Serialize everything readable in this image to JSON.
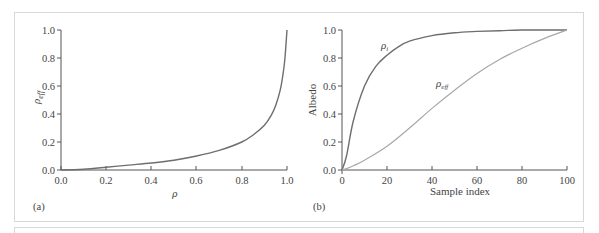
{
  "chart_data": [
    {
      "panel": "(a)",
      "type": "line",
      "title": "",
      "xlabel": "ρ",
      "ylabel": "ρ_eff",
      "xlim": [
        0.0,
        1.0
      ],
      "ylim": [
        0.0,
        1.0
      ],
      "x_ticks": [
        "0.0",
        "0.2",
        "0.4",
        "0.6",
        "0.8",
        "1.0"
      ],
      "y_ticks": [
        "0.0",
        "0.2",
        "0.4",
        "0.6",
        "0.8",
        "1.0"
      ],
      "grid": false,
      "legend": null,
      "series": [
        {
          "name": "ρ_eff",
          "x": [
            0.0,
            0.1,
            0.2,
            0.3,
            0.4,
            0.5,
            0.6,
            0.7,
            0.8,
            0.85,
            0.9,
            0.93,
            0.95,
            0.97,
            0.98,
            0.99,
            1.0
          ],
          "y": [
            0.0,
            0.006,
            0.02,
            0.035,
            0.05,
            0.07,
            0.1,
            0.14,
            0.2,
            0.25,
            0.32,
            0.39,
            0.46,
            0.57,
            0.66,
            0.78,
            1.0
          ]
        }
      ]
    },
    {
      "panel": "(b)",
      "type": "line",
      "title": "",
      "xlabel": "Sample index",
      "ylabel": "Albedo",
      "xlim": [
        0,
        100
      ],
      "ylim": [
        0.0,
        1.0
      ],
      "x_ticks": [
        "0",
        "20",
        "40",
        "60",
        "80",
        "100"
      ],
      "y_ticks": [
        "0.0",
        "0.2",
        "0.4",
        "0.6",
        "0.8",
        "1.0"
      ],
      "grid": false,
      "legend": null,
      "annotations": [
        {
          "text": "ρ_i",
          "x": 17,
          "y": 0.86
        },
        {
          "text": "ρ_eff",
          "x": 42,
          "y": 0.6
        }
      ],
      "series": [
        {
          "name": "ρ_i",
          "x": [
            0,
            2,
            5,
            10,
            15,
            20,
            25,
            30,
            40,
            50,
            60,
            70,
            80,
            90,
            100
          ],
          "y": [
            0.0,
            0.1,
            0.35,
            0.6,
            0.74,
            0.82,
            0.88,
            0.92,
            0.96,
            0.98,
            0.99,
            0.995,
            1.0,
            1.0,
            1.0
          ]
        },
        {
          "name": "ρ_eff",
          "x": [
            0,
            2,
            5,
            10,
            20,
            30,
            40,
            50,
            60,
            70,
            80,
            90,
            100
          ],
          "y": [
            0.0,
            0.01,
            0.03,
            0.07,
            0.17,
            0.3,
            0.44,
            0.57,
            0.69,
            0.79,
            0.87,
            0.94,
            1.0
          ]
        }
      ]
    }
  ],
  "labels": {
    "a": {
      "panel": "(a)",
      "xlabel": "ρ",
      "ylabel_base": "ρ",
      "ylabel_sub": "eff",
      "x_ticks": [
        "0.0",
        "0.2",
        "0.4",
        "0.6",
        "0.8",
        "1.0"
      ],
      "y_ticks": [
        "0.0",
        "0.2",
        "0.4",
        "0.6",
        "0.8",
        "1.0"
      ]
    },
    "b": {
      "panel": "(b)",
      "xlabel": "Sample index",
      "ylabel": "Albedo",
      "x_ticks": [
        "0",
        "20",
        "40",
        "60",
        "80",
        "100"
      ],
      "y_ticks": [
        "0.0",
        "0.2",
        "0.4",
        "0.6",
        "0.8",
        "1.0"
      ],
      "annot_i_base": "ρ",
      "annot_i_sub": "i",
      "annot_eff_base": "ρ",
      "annot_eff_sub": "eff"
    }
  },
  "colors": {
    "axis": "#555555",
    "curve_dark": "#6e6e6e",
    "curve_light": "#a8a8a8",
    "frame": "#d8d8d8"
  }
}
